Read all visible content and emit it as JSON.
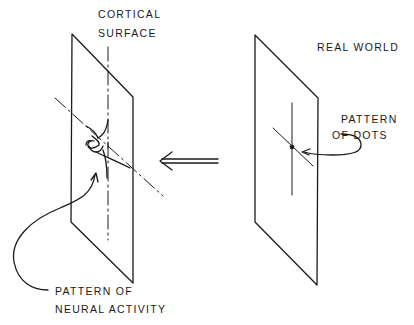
{
  "diagram": {
    "labels": {
      "cortical_surface_line1": "CORTICAL",
      "cortical_surface_line2": "SURFACE",
      "real_world": "REAL WORLD",
      "pattern_of_dots_line1": "PATTERN",
      "pattern_of_dots_line2": "OF DOTS",
      "neural_activity_line1": "PATTERN OF",
      "neural_activity_line2": "NEURAL ACTIVITY"
    },
    "panels": [
      {
        "name": "cortical-surface-plane",
        "content": "distorted neural activity pattern"
      },
      {
        "name": "real-world-plane",
        "content": "cross with central dot"
      }
    ],
    "arrow": {
      "direction": "right-to-left",
      "style": "double-line"
    },
    "colors": {
      "ink": "#1a1a1a",
      "background": "#ffffff"
    }
  }
}
